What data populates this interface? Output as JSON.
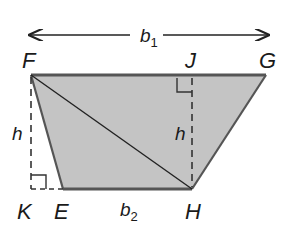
{
  "diagram": {
    "vertices": {
      "F": "F",
      "J": "J",
      "G": "G",
      "K": "K",
      "E": "E",
      "H": "H"
    },
    "labels": {
      "b1_base": "b",
      "b1_sub": "1",
      "b2_base": "b",
      "b2_sub": "2",
      "h_left": "h",
      "h_right": "h"
    },
    "colors": {
      "fill": "#c4c4c4",
      "stroke": "#555555",
      "text": "#1a1a1a"
    }
  }
}
